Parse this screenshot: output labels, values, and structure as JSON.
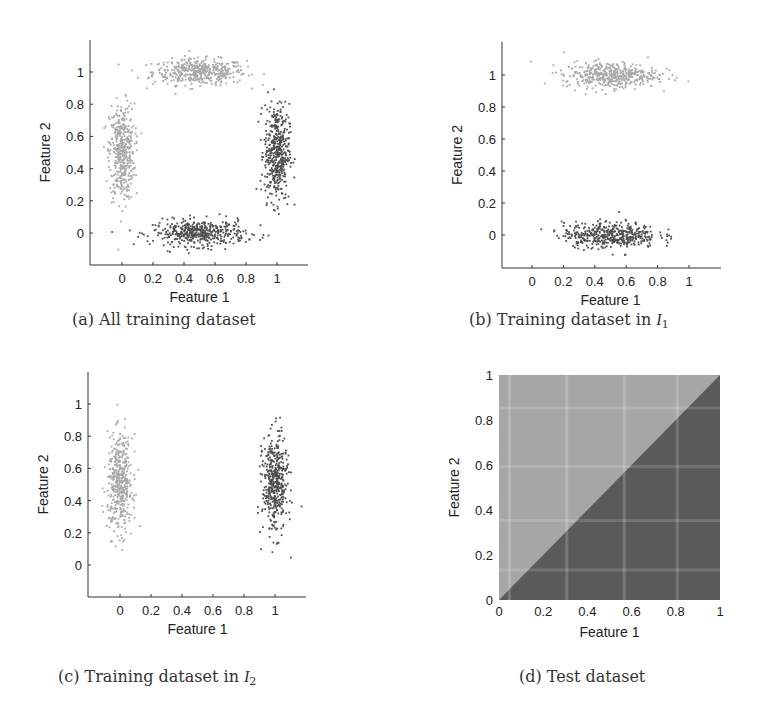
{
  "figure": {
    "panels": [
      {
        "id": "a",
        "caption_prefix": "(a) All training dataset",
        "caption_symbol": "",
        "caption_subscript": ""
      },
      {
        "id": "b",
        "caption_prefix": "(b) Training dataset in ",
        "caption_symbol": "I",
        "caption_subscript": "1"
      },
      {
        "id": "c",
        "caption_prefix": "(c) Training dataset in ",
        "caption_symbol": "I",
        "caption_subscript": "2"
      },
      {
        "id": "d",
        "caption_prefix": "(d) Test dataset",
        "caption_symbol": "",
        "caption_subscript": ""
      }
    ]
  },
  "colors": {
    "class_light": "#a9a9a9",
    "class_dark": "#4e4e4e",
    "test_light": "#a6a6a6",
    "test_dark": "#5a5a5a",
    "axis": "#333333"
  },
  "chart_data": [
    {
      "type": "scatter",
      "title": "(a) All training dataset",
      "xlabel": "Feature 1",
      "ylabel": "Feature 2",
      "xticks": [
        "0",
        "0.2",
        "0.4",
        "0.6",
        "0.8",
        "1"
      ],
      "yticks": [
        "0",
        "0.2",
        "0.4",
        "0.6",
        "0.8",
        "1"
      ],
      "xlim": [
        -0.2,
        1.2
      ],
      "ylim": [
        -0.2,
        1.2
      ],
      "grid": false,
      "series": [
        {
          "name": "Class 1 (light)",
          "clusters": [
            {
              "cx": 0.5,
              "cy": 1.0,
              "sx": 0.15,
              "sy": 0.04,
              "n": 450
            },
            {
              "cx": 0.0,
              "cy": 0.5,
              "sx": 0.04,
              "sy": 0.15,
              "n": 450
            }
          ]
        },
        {
          "name": "Class 2 (dark)",
          "clusters": [
            {
              "cx": 0.5,
              "cy": 0.0,
              "sx": 0.15,
              "sy": 0.04,
              "n": 450
            },
            {
              "cx": 1.0,
              "cy": 0.5,
              "sx": 0.04,
              "sy": 0.15,
              "n": 450
            }
          ]
        }
      ]
    },
    {
      "type": "scatter",
      "title": "(b) Training dataset in I1",
      "xlabel": "Feature 1",
      "ylabel": "Feature 2",
      "xticks": [
        "0",
        "0.2",
        "0.4",
        "0.6",
        "0.8",
        "1"
      ],
      "yticks": [
        "0",
        "0.2",
        "0.4",
        "0.6",
        "0.8",
        "1"
      ],
      "xlim": [
        -0.2,
        1.2
      ],
      "ylim": [
        -0.2,
        1.2
      ],
      "grid": false,
      "series": [
        {
          "name": "Class 1 (light)",
          "clusters": [
            {
              "cx": 0.5,
              "cy": 1.0,
              "sx": 0.15,
              "sy": 0.04,
              "n": 450
            }
          ]
        },
        {
          "name": "Class 2 (dark)",
          "clusters": [
            {
              "cx": 0.5,
              "cy": 0.0,
              "sx": 0.15,
              "sy": 0.04,
              "n": 450
            }
          ]
        }
      ]
    },
    {
      "type": "scatter",
      "title": "(c) Training dataset in I2",
      "xlabel": "Feature 1",
      "ylabel": "Feature 2",
      "xticks": [
        "0",
        "0.2",
        "0.4",
        "0.6",
        "0.8",
        "1"
      ],
      "yticks": [
        "0",
        "0.2",
        "0.4",
        "0.6",
        "0.8",
        "1"
      ],
      "xlim": [
        -0.2,
        1.2
      ],
      "ylim": [
        -0.2,
        1.2
      ],
      "grid": false,
      "series": [
        {
          "name": "Class 1 (light)",
          "clusters": [
            {
              "cx": 0.0,
              "cy": 0.5,
              "sx": 0.04,
              "sy": 0.15,
              "n": 450
            }
          ]
        },
        {
          "name": "Class 2 (dark)",
          "clusters": [
            {
              "cx": 1.0,
              "cy": 0.5,
              "sx": 0.04,
              "sy": 0.15,
              "n": 450
            }
          ]
        }
      ]
    },
    {
      "type": "heatmap",
      "title": "(d) Test dataset",
      "xlabel": "Feature 1",
      "ylabel": "Feature 2",
      "xticks": [
        "0",
        "0.2",
        "0.4",
        "0.6",
        "0.8",
        "1"
      ],
      "yticks": [
        "0",
        "0.2",
        "0.4",
        "0.6",
        "0.8",
        "1"
      ],
      "xlim": [
        0,
        1
      ],
      "ylim": [
        0,
        1
      ],
      "regions": [
        {
          "name": "Class 1 (light)",
          "condition": "Feature 2 > Feature 1"
        },
        {
          "name": "Class 2 (dark)",
          "condition": "Feature 2 < Feature 1"
        }
      ]
    }
  ]
}
